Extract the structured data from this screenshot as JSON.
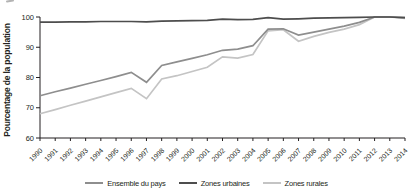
{
  "figure": {
    "background": "#ffffff",
    "axis_color": "#231f20",
    "cropped_artifact": true
  },
  "chart_data": {
    "type": "line",
    "title": "",
    "xlabel": "",
    "ylabel": "Pourcentage de la population",
    "ylim": [
      60,
      100
    ],
    "yticks": [
      60,
      70,
      80,
      90,
      100
    ],
    "grid": false,
    "legend_position": "bottom",
    "x": [
      1990,
      1991,
      1992,
      1993,
      1994,
      1995,
      1996,
      1997,
      1998,
      1999,
      2000,
      2001,
      2002,
      2003,
      2004,
      2005,
      2006,
      2007,
      2008,
      2009,
      2010,
      2011,
      2012,
      2013,
      2014
    ],
    "series": [
      {
        "name": "Ensemble du pays",
        "color": "#8e8e8e",
        "values": [
          74,
          75.3,
          76.5,
          77.8,
          79,
          80.3,
          81.7,
          78.4,
          84,
          85.2,
          86.3,
          87.5,
          89,
          89.4,
          90.5,
          96,
          96.1,
          94,
          95,
          96,
          97,
          98.2,
          100,
          100,
          99.8
        ]
      },
      {
        "name": "Zones urbaines",
        "color": "#4d4d4d",
        "values": [
          98.3,
          98.3,
          98.4,
          98.4,
          98.5,
          98.5,
          98.5,
          98.4,
          98.6,
          98.7,
          98.8,
          98.9,
          99.3,
          99.1,
          99.2,
          99.8,
          99.3,
          99.4,
          99.6,
          99.7,
          99.8,
          99.9,
          100,
          100,
          99.8
        ]
      },
      {
        "name": "Zones rurales",
        "color": "#c4c4c4",
        "values": [
          68,
          69.4,
          70.8,
          72.2,
          73.6,
          75,
          76.4,
          73,
          79.5,
          80.6,
          82,
          83.4,
          86.8,
          86.4,
          87.6,
          95.4,
          95.8,
          92,
          93.6,
          94.9,
          96,
          97.5,
          100,
          100,
          99.5
        ]
      }
    ]
  }
}
